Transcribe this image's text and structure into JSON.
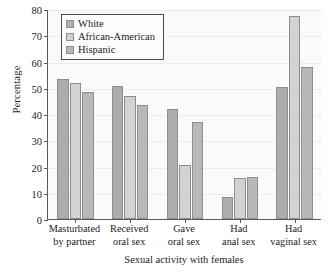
{
  "chart_data": {
    "type": "bar",
    "title": "",
    "xlabel": "Sexual activity with females",
    "ylabel": "Percentage",
    "ylim": [
      0,
      80
    ],
    "ytick_step": 10,
    "yticks": [
      0,
      10,
      20,
      30,
      40,
      50,
      60,
      70,
      80
    ],
    "grid": true,
    "legend_position": "upper-left-inside",
    "categories": [
      "Masturbated by partner",
      "Received oral sex",
      "Gave oral sex",
      "Had anal sex",
      "Had vaginal sex"
    ],
    "category_lines": [
      [
        "Masturbated",
        "by partner"
      ],
      [
        "Received",
        "oral sex"
      ],
      [
        "Gave",
        "oral sex"
      ],
      [
        "Had",
        "anal sex"
      ],
      [
        "Had",
        "vaginal sex"
      ]
    ],
    "series": [
      {
        "name": "White",
        "color": "#adadad",
        "values": [
          53.2,
          50.6,
          41.8,
          8.4,
          50.2
        ]
      },
      {
        "name": "African-American",
        "color": "#d2d2d2",
        "values": [
          51.9,
          47.0,
          20.5,
          15.6,
          77.4
        ]
      },
      {
        "name": "Hispanic",
        "color": "#b8b8b8",
        "values": [
          48.2,
          43.6,
          36.9,
          15.9,
          58.0
        ]
      }
    ]
  },
  "legend": {
    "items": [
      {
        "label": "White"
      },
      {
        "label": "African-American"
      },
      {
        "label": "Hispanic"
      }
    ]
  }
}
